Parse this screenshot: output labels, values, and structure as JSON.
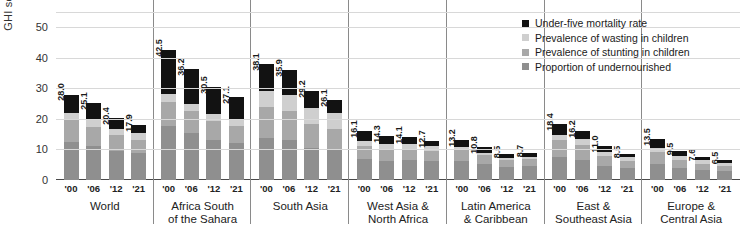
{
  "chart_data": {
    "type": "bar",
    "subtype": "stacked-grouped",
    "title": "",
    "xlabel": "",
    "ylabel": "GHI score",
    "ylim": [
      0,
      55
    ],
    "yticks": [
      0,
      10,
      20,
      30,
      40,
      50
    ],
    "grid": true,
    "legend_position": "top-right",
    "x": [
      "'00",
      "'06",
      "'12",
      "'21"
    ],
    "series": [
      {
        "name": "Under-five mortality rate",
        "color": "#121212"
      },
      {
        "name": "Prevalence of wasting in children",
        "color": "#cfcfcf"
      },
      {
        "name": "Prevalence of stunting in children",
        "color": "#a8a8a8"
      },
      {
        "name": "Proportion of undernourished",
        "color": "#8f8f8f"
      }
    ],
    "groups": [
      {
        "name": "World",
        "bars": [
          {
            "year": "'00",
            "total": 28.0,
            "undernourished": 12.6,
            "stunting": 7.0,
            "wasting": 2.4,
            "mortality": 6.0
          },
          {
            "year": "'06",
            "total": 25.1,
            "undernourished": 11.0,
            "stunting": 6.4,
            "wasting": 2.3,
            "mortality": 5.4
          },
          {
            "year": "'12",
            "total": 20.4,
            "undernourished": 9.4,
            "stunting": 5.2,
            "wasting": 2.2,
            "mortality": 3.6
          },
          {
            "year": "'21",
            "total": 17.9,
            "undernourished": 8.9,
            "stunting": 4.3,
            "wasting": 2.1,
            "mortality": 2.6
          }
        ]
      },
      {
        "name": "Africa South of the Sahara",
        "bars": [
          {
            "year": "'00",
            "total": 42.5,
            "undernourished": 17.8,
            "stunting": 7.8,
            "wasting": 2.5,
            "mortality": 14.4
          },
          {
            "year": "'06",
            "total": 36.2,
            "undernourished": 15.4,
            "stunting": 7.1,
            "wasting": 2.4,
            "mortality": 11.3
          },
          {
            "year": "'12",
            "total": 30.5,
            "undernourished": 13.0,
            "stunting": 6.3,
            "wasting": 2.3,
            "mortality": 8.9
          },
          {
            "year": "'21",
            "total": 27.1,
            "undernourished": 12.2,
            "stunting": 5.6,
            "wasting": 2.2,
            "mortality": 7.1
          }
        ]
      },
      {
        "name": "South Asia",
        "bars": [
          {
            "year": "'00",
            "total": 38.1,
            "undernourished": 13.6,
            "stunting": 10.4,
            "wasting": 5.2,
            "mortality": 8.9
          },
          {
            "year": "'06",
            "total": 35.9,
            "undernourished": 13.0,
            "stunting": 9.6,
            "wasting": 5.4,
            "mortality": 7.9
          },
          {
            "year": "'12",
            "total": 29.2,
            "undernourished": 10.6,
            "stunting": 7.9,
            "wasting": 5.2,
            "mortality": 5.5
          },
          {
            "year": "'21",
            "total": 26.1,
            "undernourished": 9.8,
            "stunting": 6.8,
            "wasting": 5.4,
            "mortality": 4.1
          }
        ]
      },
      {
        "name": "West Asia & North Africa",
        "bars": [
          {
            "year": "'00",
            "total": 16.1,
            "undernourished": 6.8,
            "stunting": 4.5,
            "wasting": 1.6,
            "mortality": 3.2
          },
          {
            "year": "'06",
            "total": 14.3,
            "undernourished": 6.2,
            "stunting": 4.0,
            "wasting": 1.6,
            "mortality": 2.5
          },
          {
            "year": "'12",
            "total": 14.1,
            "undernourished": 6.4,
            "stunting": 3.8,
            "wasting": 1.7,
            "mortality": 2.2
          },
          {
            "year": "'21",
            "total": 12.7,
            "undernourished": 6.1,
            "stunting": 3.4,
            "wasting": 1.6,
            "mortality": 1.6
          }
        ]
      },
      {
        "name": "Latin America & Caribbean",
        "bars": [
          {
            "year": "'00",
            "total": 13.2,
            "undernourished": 6.2,
            "stunting": 3.6,
            "wasting": 0.9,
            "mortality": 2.5
          },
          {
            "year": "'06",
            "total": 10.8,
            "undernourished": 5.2,
            "stunting": 2.9,
            "wasting": 0.8,
            "mortality": 1.9
          },
          {
            "year": "'12",
            "total": 8.5,
            "undernourished": 4.2,
            "stunting": 2.3,
            "wasting": 0.7,
            "mortality": 1.3
          },
          {
            "year": "'21",
            "total": 8.7,
            "undernourished": 4.6,
            "stunting": 2.2,
            "wasting": 0.7,
            "mortality": 1.2
          }
        ]
      },
      {
        "name": "East & Southeast Asia",
        "bars": [
          {
            "year": "'00",
            "total": 18.4,
            "undernourished": 7.4,
            "stunting": 5.6,
            "wasting": 1.8,
            "mortality": 3.6
          },
          {
            "year": "'06",
            "total": 16.2,
            "undernourished": 6.6,
            "stunting": 4.9,
            "wasting": 1.9,
            "mortality": 2.8
          },
          {
            "year": "'12",
            "total": 11.0,
            "undernourished": 4.6,
            "stunting": 3.2,
            "wasting": 1.5,
            "mortality": 1.7
          },
          {
            "year": "'21",
            "total": 8.5,
            "undernourished": 3.9,
            "stunting": 2.3,
            "wasting": 1.2,
            "mortality": 1.1
          }
        ]
      },
      {
        "name": "Europe & Central Asia",
        "bars": [
          {
            "year": "'00",
            "total": 13.5,
            "undernourished": 5.4,
            "stunting": 3.8,
            "wasting": 1.4,
            "mortality": 2.9
          },
          {
            "year": "'06",
            "total": 9.5,
            "undernourished": 4.0,
            "stunting": 2.7,
            "wasting": 1.2,
            "mortality": 1.6
          },
          {
            "year": "'12",
            "total": 7.6,
            "undernourished": 3.3,
            "stunting": 2.1,
            "wasting": 1.1,
            "mortality": 1.1
          },
          {
            "year": "'21",
            "total": 6.5,
            "undernourished": 2.9,
            "stunting": 1.8,
            "wasting": 1.0,
            "mortality": 0.8
          }
        ]
      }
    ]
  }
}
